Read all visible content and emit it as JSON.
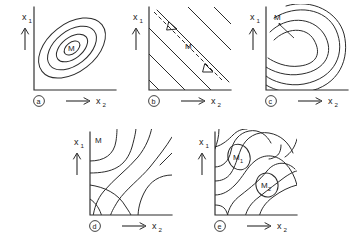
{
  "figure": {
    "title": "",
    "axis_labels": {
      "y_base": "x",
      "y_subscript": "1",
      "x_base": "x",
      "x_subscript": "2"
    },
    "colors": {
      "ink": "#2b2b2b",
      "background": "#ffffff"
    },
    "panels": [
      {
        "tag": "a",
        "type": "simple-maximum",
        "description": "Concentric tilted ellipses around a single maximum",
        "markers": [
          {
            "base": "M",
            "subscript": ""
          }
        ],
        "contour_count": 4
      },
      {
        "tag": "b",
        "type": "rising-ridge",
        "description": "Parallel straight contour lines with a dashed ridge line and double arrow",
        "markers": [
          {
            "base": "M",
            "subscript": ""
          }
        ],
        "contour_count": 8
      },
      {
        "tag": "c",
        "type": "stationary-ridge",
        "description": "Nested open curved contours with maximum indicated by a pointer",
        "markers": [
          {
            "base": "M",
            "subscript": ""
          }
        ],
        "contour_count": 4
      },
      {
        "tag": "d",
        "type": "saddle-point",
        "description": "Hyperbolic saddle or minimax contour pattern",
        "markers": [
          {
            "base": "M",
            "subscript": ""
          }
        ],
        "contour_count": 6
      },
      {
        "tag": "e",
        "type": "two-maxima",
        "description": "Two separate local maxima with winding contours",
        "markers": [
          {
            "base": "M",
            "subscript": "1"
          },
          {
            "base": "M",
            "subscript": "2"
          }
        ],
        "contour_count": 8
      }
    ]
  }
}
